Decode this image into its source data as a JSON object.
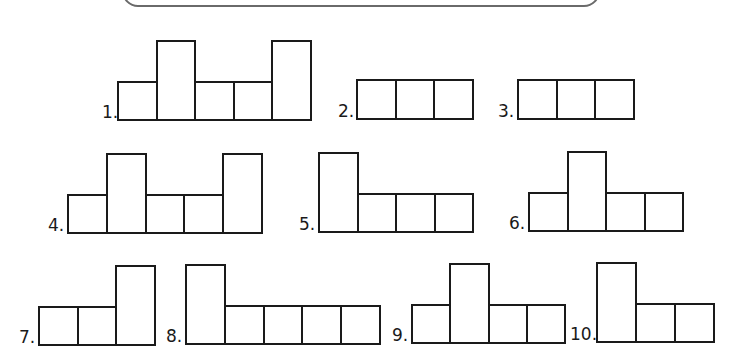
{
  "banner": {
    "visible": true
  },
  "figures": [
    {
      "label": "1.",
      "label_x": 102,
      "left": 117,
      "cell_width": 38.6,
      "bottom": 121,
      "short_top": 81,
      "tall_top": 40,
      "cells": [
        "short",
        "tall",
        "short",
        "short",
        "tall"
      ]
    },
    {
      "label": "2.",
      "label_x": 338,
      "left": 356,
      "cell_width": 38.7,
      "bottom": 120,
      "short_top": 79,
      "tall_top": 79,
      "cells": [
        "short",
        "short",
        "short"
      ]
    },
    {
      "label": "3.",
      "label_x": 498,
      "left": 517,
      "cell_width": 38.5,
      "bottom": 120,
      "short_top": 79,
      "tall_top": 79,
      "cells": [
        "short",
        "short",
        "short"
      ]
    },
    {
      "label": "4.",
      "label_x": 48,
      "left": 67,
      "cell_width": 38.8,
      "bottom": 234,
      "short_top": 194,
      "tall_top": 153,
      "cells": [
        "short",
        "tall",
        "short",
        "short",
        "tall"
      ]
    },
    {
      "label": "5.",
      "label_x": 299,
      "left": 318,
      "cell_width": 38.5,
      "bottom": 233,
      "short_top": 193,
      "tall_top": 152,
      "cells": [
        "tall",
        "short",
        "short",
        "short"
      ]
    },
    {
      "label": "6.",
      "label_x": 509,
      "left": 528,
      "cell_width": 38.5,
      "bottom": 232,
      "short_top": 192,
      "tall_top": 151,
      "cells": [
        "short",
        "tall",
        "short",
        "short"
      ]
    },
    {
      "label": "7.",
      "label_x": 19,
      "left": 38,
      "cell_width": 38.7,
      "bottom": 346,
      "short_top": 306,
      "tall_top": 265,
      "cells": [
        "short",
        "short",
        "tall"
      ]
    },
    {
      "label": "8.",
      "label_x": 166,
      "left": 185,
      "cell_width": 38.8,
      "bottom": 345,
      "short_top": 305,
      "tall_top": 264,
      "cells": [
        "tall",
        "short",
        "short",
        "short",
        "short"
      ]
    },
    {
      "label": "9.",
      "label_x": 392,
      "left": 411,
      "cell_width": 38.3,
      "bottom": 344,
      "short_top": 304,
      "tall_top": 263,
      "cells": [
        "short",
        "tall",
        "short",
        "short"
      ]
    },
    {
      "label": "10.",
      "label_x": 570,
      "left": 596,
      "cell_width": 39.0,
      "bottom": 343,
      "short_top": 303,
      "tall_top": 262,
      "cells": [
        "tall",
        "short",
        "short"
      ]
    }
  ],
  "colors": {
    "line": "#1a1a1a",
    "banner_border": "#6a6a6a",
    "background": "#ffffff"
  }
}
